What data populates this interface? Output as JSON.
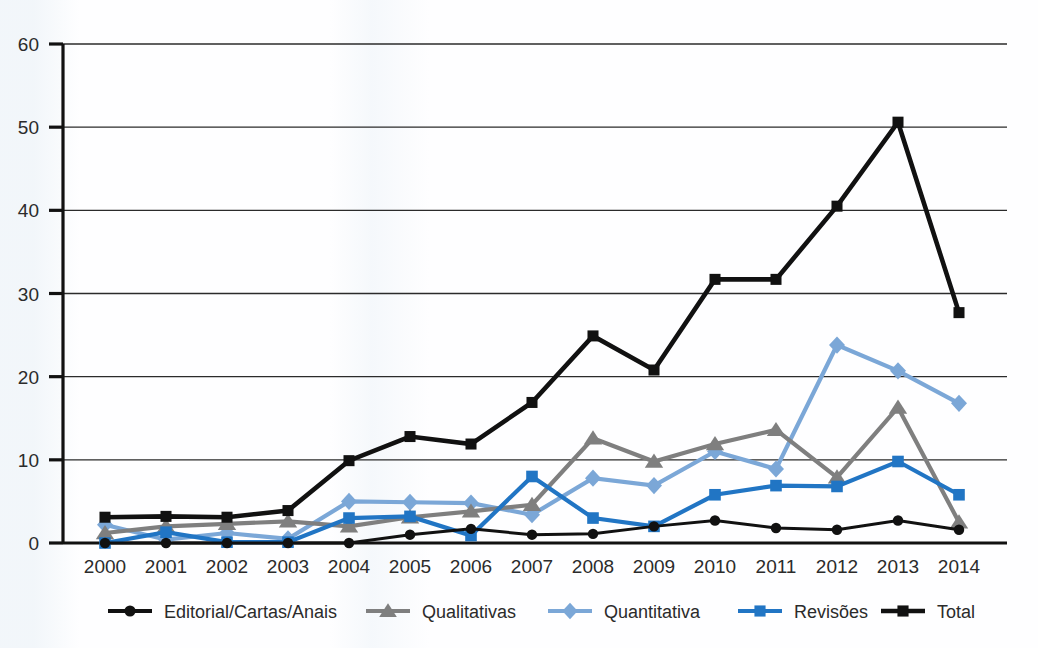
{
  "chart_data": {
    "type": "line",
    "title": "",
    "subtitle": "",
    "xlabel": "",
    "ylabel": "",
    "categories": [
      "2000",
      "2001",
      "2002",
      "2003",
      "2004",
      "2005",
      "2006",
      "2007",
      "2008",
      "2009",
      "2010",
      "2011",
      "2012",
      "2013",
      "2014"
    ],
    "xlim": [
      2000,
      2014
    ],
    "ylim": [
      0,
      60
    ],
    "yticks": [
      0,
      10,
      20,
      30,
      40,
      50,
      60
    ],
    "grid": true,
    "legend_position": "bottom",
    "series": [
      {
        "name": "Editorial/Cartas/Anais",
        "color": "#111111",
        "marker": "circle",
        "values": [
          0,
          0,
          0,
          0,
          0,
          1.0,
          1.7,
          1.0,
          1.1,
          2.0,
          2.7,
          1.8,
          1.6,
          2.7,
          1.6
        ]
      },
      {
        "name": "Qualitativas",
        "color": "#7f7f7f",
        "marker": "triangle",
        "values": [
          1.2,
          2.0,
          2.3,
          2.6,
          2.0,
          3.1,
          3.8,
          4.6,
          12.6,
          9.8,
          11.9,
          13.6,
          7.9,
          16.3,
          2.5
        ]
      },
      {
        "name": "Quantitativa",
        "color": "#7BA7D7",
        "marker": "diamond",
        "values": [
          2.2,
          0.4,
          1.2,
          0.5,
          5.0,
          4.9,
          4.8,
          3.4,
          7.8,
          6.9,
          11.0,
          8.9,
          23.8,
          20.7,
          16.8
        ]
      },
      {
        "name": "Revisões",
        "color": "#2175C4",
        "marker": "square",
        "values": [
          0,
          1.3,
          0.1,
          0.1,
          3.0,
          3.2,
          0.9,
          8.0,
          3.0,
          2.0,
          5.8,
          6.9,
          6.8,
          9.8,
          5.8
        ]
      },
      {
        "name": "Total",
        "color": "#111111",
        "marker": "square",
        "values": [
          3.1,
          3.2,
          3.1,
          3.9,
          9.9,
          12.8,
          11.9,
          16.9,
          24.9,
          20.8,
          31.7,
          31.7,
          40.5,
          50.6,
          27.7
        ]
      }
    ]
  },
  "legend": {
    "items": [
      {
        "label": "Editorial/Cartas/Anais",
        "marker": "circle-marker",
        "color": "#111111"
      },
      {
        "label": "Qualitativas",
        "marker": "triangle-marker",
        "color": "#7f7f7f"
      },
      {
        "label": "Quantitativa",
        "marker": "diamond-marker",
        "color": "#7BA7D7"
      },
      {
        "label": "Revisões",
        "marker": "square-marker",
        "color": "#2175C4"
      },
      {
        "label": "Total",
        "marker": "square-marker",
        "color": "#111111"
      }
    ]
  },
  "axes": {
    "y_tick_labels": [
      "0",
      "10",
      "20",
      "30",
      "40",
      "50",
      "60"
    ],
    "x_tick_labels": [
      "2000",
      "2001",
      "2002",
      "2003",
      "2004",
      "2005",
      "2006",
      "2007",
      "2008",
      "2009",
      "2010",
      "2011",
      "2012",
      "2013",
      "2014"
    ]
  }
}
